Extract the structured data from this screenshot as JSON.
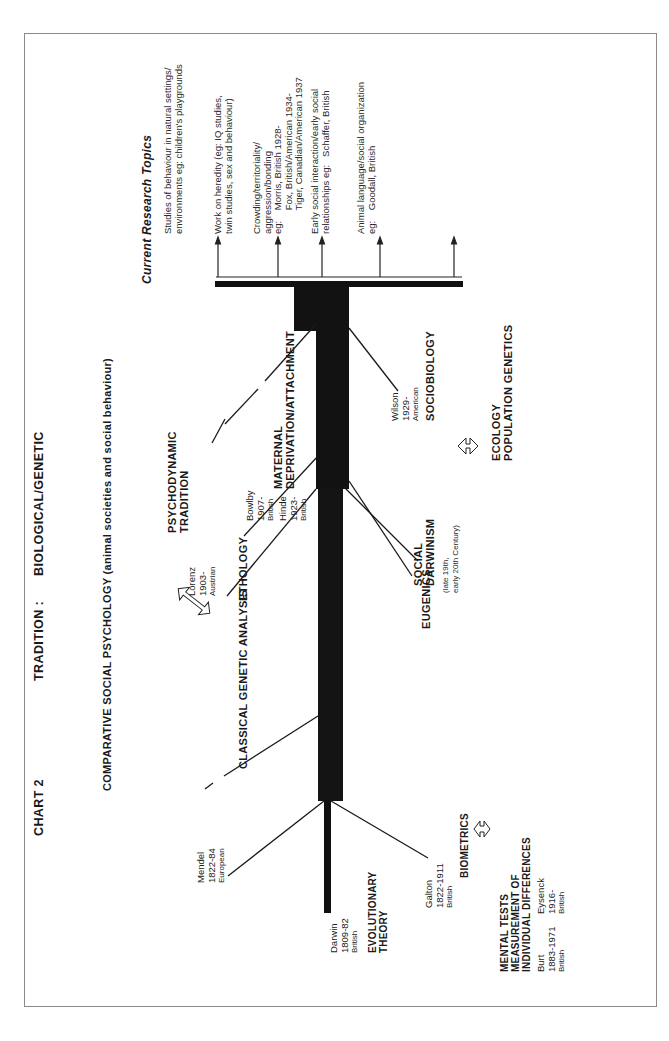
{
  "header": {
    "chart_label": "CHART 2",
    "tradition_label": "TRADITION  :",
    "tradition_value": "BIOLOGICAL/GENETIC"
  },
  "branches_above": {
    "comparative_social_psychology": "COMPARATIVE SOCIAL PSYCHOLOGY (animal societies and social behaviour)",
    "classical_genetic_analysis": "CLASSICAL GENETIC ANALYSIS",
    "ethology": "ETHOLOGY",
    "psychodynamic_tradition": [
      "PSYCHODYNAMIC",
      "TRADITION"
    ],
    "maternal_deprivation": [
      "MATERNAL",
      "DEPRIVATION/ATTACHMENT"
    ]
  },
  "branches_below": {
    "biometrics": "BIOMETRICS",
    "mental_tests": [
      "MENTAL TESTS",
      "MEASUREMENT OF",
      "INDIVIDUAL DIFFERENCES"
    ],
    "eugenics": "EUGENICS",
    "social_darwinism": [
      "SOCIAL",
      "DARWINISM"
    ],
    "social_darwinism_note": [
      "(late 19th,",
      "early 20th Century)"
    ],
    "sociobiology": "SOCIOBIOLOGY",
    "ecology": [
      "ECOLOGY",
      "POPULATION GENETICS"
    ]
  },
  "root": {
    "title": [
      "EVOLUTIONARY",
      "THEORY"
    ]
  },
  "people": {
    "darwin": {
      "name": "Darwin",
      "years": "1809-82",
      "nationality": "British"
    },
    "mendel": {
      "name": "Mendel",
      "years": "1822-84",
      "nationality": "European"
    },
    "galton": {
      "name": "Galton",
      "years": "1822-1911",
      "nationality": "British"
    },
    "burt": {
      "name": "Burt",
      "years": "1883-1971",
      "nationality": "British"
    },
    "eysenck": {
      "name": "Eysenck",
      "years": "1916-",
      "nationality": "British"
    },
    "lorenz": {
      "name": "Lorenz",
      "years": "1903-",
      "nationality": "Austrian"
    },
    "bowlby": {
      "name": "Bowlby",
      "years": "1907-",
      "nationality": "British"
    },
    "hinde": {
      "name": "Hinde",
      "years": "1923-",
      "nationality": "British"
    },
    "wilson": {
      "name": "Wilson",
      "years": "1929-",
      "nationality": "American"
    }
  },
  "research_topics": {
    "title": "Current Research Topics",
    "items": [
      {
        "lines": [
          "Studies of behaviour in natural settings/",
          "environments eg: children's playgrounds"
        ]
      },
      {
        "lines": [
          "Work on heredity (eg: IQ studies,",
          "twin studies, sex and behaviour)"
        ]
      },
      {
        "lines": [
          "Crowding/territoriality/",
          "aggression/bonding",
          "eg:    Morris, British 1928-",
          "         Fox, British/American 1934-",
          "         Tiger, Canadian/American 1937"
        ]
      },
      {
        "lines": [
          "Early social interaction/early social",
          "relationships eg:   Schaffer, British"
        ]
      },
      {
        "lines": [
          "Animal language/social organization",
          "eg:    Goodall, British"
        ]
      }
    ]
  },
  "colors": {
    "ink": "#111111",
    "border": "#8a8a8a",
    "background": "#ffffff"
  }
}
